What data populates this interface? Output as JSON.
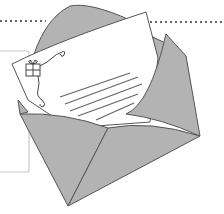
{
  "illustration": {
    "subject": "open-envelope-with-letter",
    "elements": {
      "envelope": {
        "label": "Open envelope",
        "fill": "#b3b3b3",
        "stroke": "#555555"
      },
      "letter": {
        "label": "Letter sheet",
        "fill": "#ffffff",
        "stroke": "#555555",
        "line_count": 5
      },
      "gift_icon": {
        "label": "Gift box doodle"
      },
      "dotted_line": {
        "label": "Dotted divider",
        "color": "#666666"
      },
      "frame": {
        "label": "Side frame",
        "color": "#c8c8c8"
      }
    }
  }
}
